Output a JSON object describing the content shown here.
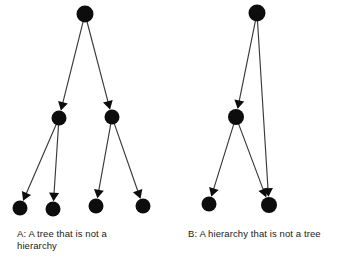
{
  "figure": {
    "background_color": "#ffffff",
    "node_color": "#0d0d0d",
    "edge_color": "#3a3a3a",
    "text_color": "#1a1a1a",
    "width": 356,
    "height": 263
  },
  "chart_data": {
    "type": "diagram",
    "diagram_kind": "directed-graph",
    "panels": [
      {
        "id": "A",
        "caption": "A: A tree that is not a\nhierarchy",
        "caption_line_1": "A: A tree that is not a",
        "caption_line_2": "hierarchy",
        "node_count": 7,
        "edge_count": 6,
        "nodes": [
          {
            "id": "a-root",
            "label": "",
            "x": 85,
            "y": 14,
            "r": 8.5,
            "level": 0
          },
          {
            "id": "a-mid-left",
            "label": "",
            "x": 59,
            "y": 118,
            "r": 7.5,
            "level": 1
          },
          {
            "id": "a-mid-right",
            "label": "",
            "x": 112,
            "y": 117,
            "r": 7.5,
            "level": 1
          },
          {
            "id": "a-leaf-1",
            "label": "",
            "x": 20,
            "y": 208,
            "r": 7.5,
            "level": 2
          },
          {
            "id": "a-leaf-2",
            "label": "",
            "x": 53,
            "y": 209,
            "r": 7.5,
            "level": 2
          },
          {
            "id": "a-leaf-3",
            "label": "",
            "x": 96,
            "y": 206,
            "r": 7.5,
            "level": 2
          },
          {
            "id": "a-leaf-4",
            "label": "",
            "x": 143,
            "y": 206,
            "r": 7.5,
            "level": 2
          }
        ],
        "edges": [
          {
            "from": "a-root",
            "to": "a-mid-left",
            "directed": true
          },
          {
            "from": "a-root",
            "to": "a-mid-right",
            "directed": true
          },
          {
            "from": "a-mid-left",
            "to": "a-leaf-1",
            "directed": true
          },
          {
            "from": "a-mid-left",
            "to": "a-leaf-2",
            "directed": true
          },
          {
            "from": "a-mid-right",
            "to": "a-leaf-3",
            "directed": true
          },
          {
            "from": "a-mid-right",
            "to": "a-leaf-4",
            "directed": true
          }
        ]
      },
      {
        "id": "B",
        "caption": "B: A hierarchy that is not a tree",
        "caption_line_1": "B: A hierarchy that is not a tree",
        "caption_line_2": "",
        "node_count": 4,
        "edge_count": 4,
        "nodes": [
          {
            "id": "b-root",
            "label": "",
            "x": 257,
            "y": 13,
            "r": 8.5,
            "level": 0
          },
          {
            "id": "b-mid",
            "label": "",
            "x": 236,
            "y": 117,
            "r": 8.0,
            "level": 1
          },
          {
            "id": "b-leaf-left",
            "label": "",
            "x": 209,
            "y": 204,
            "r": 7.5,
            "level": 2
          },
          {
            "id": "b-leaf-right",
            "label": "",
            "x": 269,
            "y": 205,
            "r": 8.0,
            "level": 2
          }
        ],
        "edges": [
          {
            "from": "b-root",
            "to": "b-mid",
            "directed": true
          },
          {
            "from": "b-root",
            "to": "b-leaf-right",
            "directed": true
          },
          {
            "from": "b-mid",
            "to": "b-leaf-left",
            "directed": true
          },
          {
            "from": "b-mid",
            "to": "b-leaf-right",
            "directed": true
          }
        ]
      }
    ]
  }
}
